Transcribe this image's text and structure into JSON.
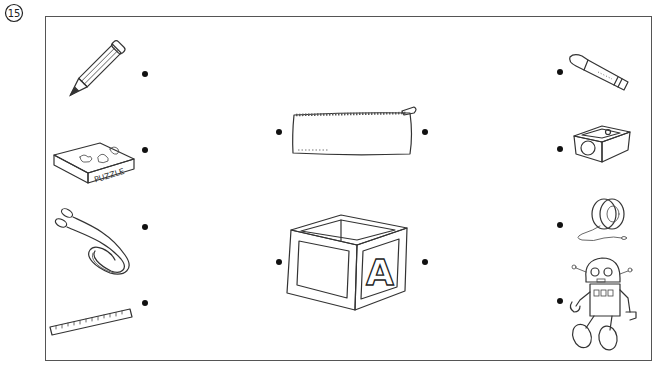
{
  "worksheet": {
    "question_number": "15",
    "question_number_glyph": "⑮",
    "instruction": "",
    "frame_color": "#555555",
    "dot_color": "#111111"
  },
  "left_column": [
    {
      "id": "pencil",
      "name": "pencil",
      "label": ""
    },
    {
      "id": "puzzle",
      "name": "puzzle box",
      "label": "PUZZLE"
    },
    {
      "id": "jump-rope",
      "name": "jump rope",
      "label": ""
    },
    {
      "id": "ruler",
      "name": "ruler",
      "label": ""
    }
  ],
  "center_column": [
    {
      "id": "pencil-case",
      "name": "pencil case",
      "label": ""
    },
    {
      "id": "toy-block",
      "name": "toy block",
      "label": "A"
    }
  ],
  "right_column": [
    {
      "id": "crayon",
      "name": "crayon",
      "label": ""
    },
    {
      "id": "sharpener",
      "name": "pencil sharpener",
      "label": ""
    },
    {
      "id": "yoyo",
      "name": "yo-yo",
      "label": ""
    },
    {
      "id": "robot",
      "name": "toy robot",
      "label": ""
    }
  ]
}
